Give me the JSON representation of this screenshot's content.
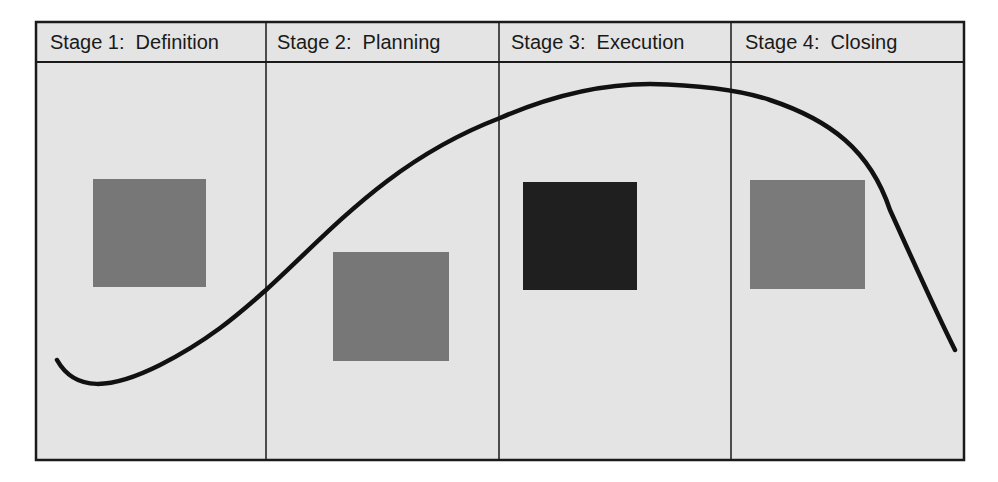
{
  "diagram": {
    "type": "project-life-cycle",
    "background_color": "#e4e4e4",
    "line_color": "#111111",
    "stages": [
      {
        "label": "Stage 1:  Definition",
        "square_color": "#777777",
        "square": {
          "x": 93,
          "y": 179,
          "w": 113,
          "h": 108
        }
      },
      {
        "label": "Stage 2:  Planning",
        "square_color": "#777777",
        "square": {
          "x": 333,
          "y": 252,
          "w": 116,
          "h": 109
        }
      },
      {
        "label": "Stage 3:  Execution",
        "square_color": "#1f1f1f",
        "square": {
          "x": 523,
          "y": 182,
          "w": 114,
          "h": 108
        }
      },
      {
        "label": "Stage 4:  Closing",
        "square_color": "#7a7a7a",
        "square": {
          "x": 750,
          "y": 180,
          "w": 115,
          "h": 109
        }
      }
    ],
    "curve": {
      "description": "Effort/activity level curve rising from a low start, peaking during Execution, dropping sharply in Closing",
      "path": "M 57 360 C 75 392, 110 390, 160 365 C 215 337, 245 308, 266 290 C 330 232, 390 160, 500 118 C 560 92, 610 84, 650 84 C 700 85, 740 90, 770 100 C 830 120, 870 150, 890 210 C 915 265, 935 310, 955 350"
    }
  }
}
